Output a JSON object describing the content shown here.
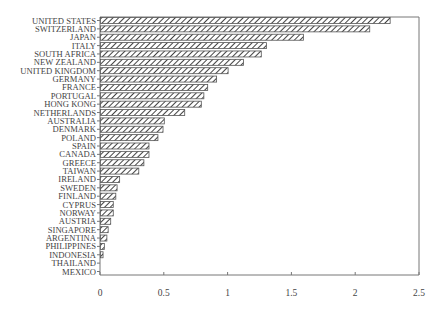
{
  "chart_data": {
    "type": "bar",
    "orientation": "horizontal",
    "title": "",
    "xlabel": "",
    "ylabel": "",
    "xlim": [
      0,
      2.5
    ],
    "xticks": [
      0,
      0.5,
      1,
      1.5,
      2,
      2.5
    ],
    "xtick_labels": [
      "0",
      "0.5",
      "1",
      "1.5",
      "2",
      "2.5"
    ],
    "grid": false,
    "legend": null,
    "bar_style": "diagonal hatch, gray/black on white",
    "categories": [
      "UNITED STATES",
      "SWITZERLAND",
      "JAPAN",
      "ITALY",
      "SOUTH AFRICA",
      "NEW ZEALAND",
      "UNITED KINGDOM",
      "GERMANY",
      "FRANCE",
      "PORTUGAL",
      "HONG KONG",
      "NETHERLANDS",
      "AUSTRALIA",
      "DENMARK",
      "POLAND",
      "SPAIN",
      "CANADA",
      "GREECE",
      "TAIWAN",
      "IRELAND",
      "SWEDEN",
      "FINLAND",
      "CYPRUS",
      "NORWAY",
      "AUSTRIA",
      "SINGAPORE",
      "ARGENTINA",
      "PHILIPPINES",
      "INDONESIA",
      "THAILAND",
      "MEXICO"
    ],
    "values": [
      2.27,
      2.11,
      1.59,
      1.3,
      1.26,
      1.12,
      1.0,
      0.91,
      0.84,
      0.81,
      0.79,
      0.66,
      0.5,
      0.49,
      0.45,
      0.38,
      0.38,
      0.34,
      0.3,
      0.15,
      0.13,
      0.12,
      0.1,
      0.1,
      0.08,
      0.06,
      0.05,
      0.03,
      0.02,
      0.0,
      0.0
    ]
  },
  "colors": {
    "axis": "#777777",
    "bar_outline": "#555555",
    "hatch": "#444444",
    "text": "#444444"
  }
}
